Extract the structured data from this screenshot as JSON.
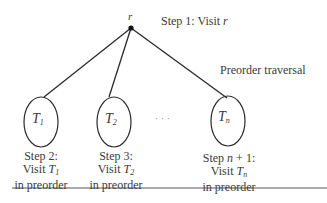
{
  "diagram": {
    "title": "Preorder traversal",
    "root": {
      "label": "r",
      "x": 131,
      "y": 28
    },
    "root_step": {
      "prefix": "Step 1: Visit ",
      "var": "r"
    },
    "subtrees": [
      {
        "label": "T",
        "sub": "1",
        "cx": 41,
        "cy": 122,
        "step_line1": "Step 2:",
        "step_visit": "Visit ",
        "step_var": "T",
        "step_sub": "1",
        "step_line3": "in preorder"
      },
      {
        "label": "T",
        "sub": "2",
        "cx": 114,
        "cy": 122,
        "step_line1": "Step 3:",
        "step_visit": "Visit ",
        "step_var": "T",
        "step_sub": "2",
        "step_line3": "in preorder"
      },
      {
        "label": "T",
        "sub": "n",
        "cx": 228,
        "cy": 122,
        "step_line1": "Step n + 1:",
        "step_visit": "Visit ",
        "step_var": "T",
        "step_sub": "n",
        "step_line3": "in preorder"
      }
    ],
    "ellipsis": "· · ·",
    "edges": [
      {
        "from": "r",
        "to": "T1"
      },
      {
        "from": "r",
        "to": "T2"
      },
      {
        "from": "r",
        "to": "Tn"
      }
    ]
  }
}
